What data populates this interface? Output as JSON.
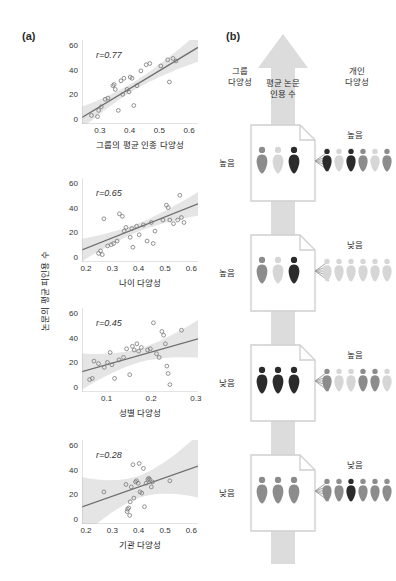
{
  "panel_a": {
    "tag": "(a)",
    "y_axis_title": "논문의 평균 피인용 수",
    "plots": [
      {
        "r_label": "r",
        "r_value": "=0.77",
        "xlabel": "그룹의 평균 인종 다양성",
        "xticks": [
          "0.3",
          "0.4",
          "0.5",
          "0.6"
        ],
        "yticks": [
          "0",
          "20",
          "40",
          "60"
        ],
        "xlim": [
          0.24,
          0.63
        ],
        "ylim": [
          -4,
          64
        ],
        "fit": {
          "x0": 0.245,
          "y0": 2,
          "x1": 0.575,
          "y1": 50
        },
        "band": 6,
        "points": [
          [
            0.272,
            3
          ],
          [
            0.292,
            2
          ],
          [
            0.296,
            7
          ],
          [
            0.305,
            10
          ],
          [
            0.318,
            16
          ],
          [
            0.327,
            17
          ],
          [
            0.344,
            27
          ],
          [
            0.348,
            28
          ],
          [
            0.352,
            24
          ],
          [
            0.362,
            7
          ],
          [
            0.371,
            31
          ],
          [
            0.377,
            20
          ],
          [
            0.381,
            33
          ],
          [
            0.392,
            24
          ],
          [
            0.398,
            22
          ],
          [
            0.402,
            34
          ],
          [
            0.408,
            33
          ],
          [
            0.414,
            11
          ],
          [
            0.425,
            27
          ],
          [
            0.438,
            39
          ],
          [
            0.456,
            44
          ],
          [
            0.468,
            45
          ],
          [
            0.505,
            43
          ],
          [
            0.528,
            48
          ],
          [
            0.534,
            30
          ],
          [
            0.546,
            49
          ],
          [
            0.556,
            47
          ]
        ]
      },
      {
        "r_label": "r",
        "r_value": "=0.65",
        "xlabel": "나이 다양성",
        "xticks": [
          "0.2",
          "0.3",
          "0.4",
          "0.5",
          "0.6"
        ],
        "yticks": [
          "0",
          "20",
          "40",
          "60"
        ],
        "xlim": [
          0.185,
          0.625
        ],
        "ylim": [
          -4,
          64
        ],
        "fit": {
          "x0": 0.2,
          "y0": 7,
          "x1": 0.6,
          "y1": 41
        },
        "band": 6,
        "points": [
          [
            0.248,
            3
          ],
          [
            0.255,
            5
          ],
          [
            0.262,
            2
          ],
          [
            0.268,
            31
          ],
          [
            0.282,
            9
          ],
          [
            0.296,
            10
          ],
          [
            0.305,
            11
          ],
          [
            0.318,
            13
          ],
          [
            0.327,
            35
          ],
          [
            0.338,
            33
          ],
          [
            0.345,
            21
          ],
          [
            0.352,
            24
          ],
          [
            0.368,
            16
          ],
          [
            0.374,
            23
          ],
          [
            0.378,
            8
          ],
          [
            0.392,
            25
          ],
          [
            0.402,
            18
          ],
          [
            0.418,
            26
          ],
          [
            0.432,
            13
          ],
          [
            0.448,
            28
          ],
          [
            0.455,
            11
          ],
          [
            0.462,
            21
          ],
          [
            0.492,
            30
          ],
          [
            0.505,
            42
          ],
          [
            0.512,
            40
          ],
          [
            0.518,
            30
          ],
          [
            0.532,
            27
          ],
          [
            0.548,
            30
          ],
          [
            0.556,
            50
          ],
          [
            0.562,
            32
          ],
          [
            0.572,
            28
          ]
        ]
      },
      {
        "r_label": "r",
        "r_value": "=0.45",
        "xlabel": "성별 다양성",
        "xticks": [
          "0.1",
          "0.2",
          "0.3"
        ],
        "yticks": [
          "0",
          "20",
          "40",
          "60"
        ],
        "xlim": [
          0.045,
          0.305
        ],
        "ylim": [
          -4,
          64
        ],
        "fit": {
          "x0": 0.05,
          "y0": 13,
          "x1": 0.295,
          "y1": 38
        },
        "band": 10,
        "points": [
          [
            0.062,
            6
          ],
          [
            0.068,
            7
          ],
          [
            0.072,
            21
          ],
          [
            0.082,
            19
          ],
          [
            0.095,
            16
          ],
          [
            0.102,
            20
          ],
          [
            0.108,
            28
          ],
          [
            0.112,
            18
          ],
          [
            0.118,
            7
          ],
          [
            0.128,
            22
          ],
          [
            0.138,
            24
          ],
          [
            0.145,
            31
          ],
          [
            0.152,
            10
          ],
          [
            0.158,
            33
          ],
          [
            0.162,
            30
          ],
          [
            0.168,
            35
          ],
          [
            0.172,
            29
          ],
          [
            0.178,
            32
          ],
          [
            0.192,
            30
          ],
          [
            0.198,
            31
          ],
          [
            0.205,
            52
          ],
          [
            0.212,
            27
          ],
          [
            0.218,
            24
          ],
          [
            0.224,
            45
          ],
          [
            0.228,
            42
          ],
          [
            0.232,
            35
          ],
          [
            0.235,
            17
          ],
          [
            0.238,
            11
          ],
          [
            0.242,
            2
          ],
          [
            0.268,
            46
          ]
        ]
      },
      {
        "r_label": "r",
        "r_value": "=0.28",
        "xlabel": "기관 다양성",
        "xticks": [
          "0.2",
          "0.3",
          "0.4",
          "0.5",
          "0.6"
        ],
        "yticks": [
          "0",
          "20",
          "40",
          "60"
        ],
        "xlim": [
          0.185,
          0.625
        ],
        "ylim": [
          -4,
          64
        ],
        "fit": {
          "x0": 0.2,
          "y0": 11,
          "x1": 0.6,
          "y1": 41
        },
        "band": 16,
        "points": [
          [
            0.268,
            22
          ],
          [
            0.352,
            28
          ],
          [
            0.356,
            6
          ],
          [
            0.358,
            8
          ],
          [
            0.362,
            9
          ],
          [
            0.366,
            3
          ],
          [
            0.368,
            14
          ],
          [
            0.372,
            26
          ],
          [
            0.378,
            44
          ],
          [
            0.382,
            17
          ],
          [
            0.388,
            30
          ],
          [
            0.392,
            31
          ],
          [
            0.398,
            29
          ],
          [
            0.402,
            45
          ],
          [
            0.405,
            22
          ],
          [
            0.412,
            21
          ],
          [
            0.418,
            41
          ],
          [
            0.422,
            10
          ],
          [
            0.428,
            29
          ],
          [
            0.435,
            32
          ],
          [
            0.438,
            33
          ],
          [
            0.442,
            32
          ],
          [
            0.448,
            26
          ],
          [
            0.452,
            30
          ],
          [
            0.518,
            31
          ]
        ]
      }
    ]
  },
  "panel_b": {
    "tag": "(b)",
    "arrow_label": "평균 논문\n인용 수",
    "head_group": "그룹\n다양성",
    "head_indiv": "개인\n다양성",
    "colors": {
      "dark": "#2b2b2b",
      "mid": "#8c8c8c",
      "light": "#d6d6d6",
      "arrow": "#dcdcdc",
      "doc": "#ffffff",
      "doc_border": "#d0d0d0"
    },
    "rows": [
      {
        "group_label": "높음",
        "indiv_label": "높음",
        "group_people": [
          "mid",
          "light",
          "dark"
        ],
        "indiv_people": [
          "dark",
          "light",
          "dark",
          "mid",
          "light",
          "mid"
        ]
      },
      {
        "group_label": "높음",
        "indiv_label": "낮음",
        "group_people": [
          "mid",
          "light",
          "dark"
        ],
        "indiv_people": [
          "light",
          "light",
          "light",
          "light",
          "light",
          "light"
        ]
      },
      {
        "group_label": "낮음",
        "indiv_label": "높음",
        "group_people": [
          "dark",
          "dark",
          "dark"
        ],
        "indiv_people": [
          "mid",
          "light",
          "light",
          "mid",
          "mid",
          "light"
        ]
      },
      {
        "group_label": "낮음",
        "indiv_label": "낮음",
        "group_people": [
          "mid",
          "mid",
          "mid"
        ],
        "indiv_people": [
          "mid",
          "mid",
          "dark",
          "mid",
          "mid",
          "mid"
        ]
      }
    ]
  }
}
